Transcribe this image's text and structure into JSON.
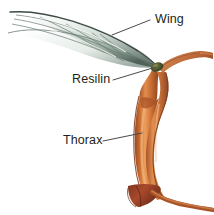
{
  "figure": {
    "background_color": "#ffffff"
  },
  "labels": [
    {
      "id": "wing",
      "text": "Wing",
      "leader_from": [
        150,
        20
      ],
      "leader_to": [
        112,
        35
      ]
    },
    {
      "id": "resilin",
      "text": "Resilin",
      "leader_from": [
        113,
        80
      ],
      "leader_to": [
        156,
        67
      ]
    },
    {
      "id": "thorax",
      "text": "Thorax",
      "leader_from": [
        103,
        141
      ],
      "leader_to": [
        142,
        133
      ]
    }
  ],
  "structures": {
    "wing": {
      "name": "Wing",
      "description": "Translucent membranous wing with veins, sweeping up and to the left",
      "colors": {
        "membrane_light": "#f2f5f3",
        "membrane_mid": "#b9c9c0",
        "membrane_dark": "#5d6f66",
        "edge": "#3c4a44",
        "vein": "#7f8c85"
      }
    },
    "resilin": {
      "name": "Resilin",
      "description": "Dark olive elastic pad at the wing hinge",
      "colors": {
        "pad": "#3f4a29",
        "pad_highlight": "#6d7340"
      }
    },
    "thorax": {
      "name": "Thorax",
      "description": "Orange-brown twisted tubular thoracic wall with flared base",
      "colors": {
        "mid": "#c86a32",
        "light": "#e69a5a",
        "dark": "#8e4220",
        "base_dark": "#8c3b26",
        "arm": "#b56239"
      }
    }
  },
  "leader_line": {
    "color": "#4a4a4a",
    "width": 1
  },
  "text_color": "#231f20"
}
